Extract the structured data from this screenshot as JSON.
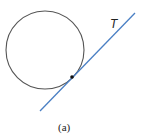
{
  "diagram": {
    "tangent_label": "T",
    "caption": "(a)",
    "circle": {
      "cx": 45,
      "cy": 50,
      "r": 39,
      "stroke": "#555555"
    },
    "tangent_line": {
      "x1": 40,
      "y1": 111,
      "x2": 135,
      "y2": 13,
      "stroke": "#4a7fc4"
    },
    "tangent_point": {
      "x": 72,
      "y": 77,
      "fill": "#111111"
    }
  }
}
